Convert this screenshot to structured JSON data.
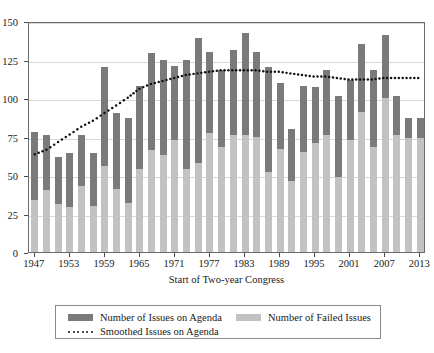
{
  "chart_data": {
    "type": "bar",
    "title": "",
    "subtitle": "",
    "xlabel": "Start of Two-year Congress",
    "ylabel": "",
    "grid": true,
    "stacked": true,
    "legend_position": "bottom",
    "xlim": [
      1946,
      2014
    ],
    "ylim": [
      0,
      150
    ],
    "yticks": [
      0,
      25,
      50,
      75,
      100,
      125,
      150
    ],
    "ytick_labels": [
      "0",
      "25",
      "50",
      "75",
      "100",
      "125",
      "150"
    ],
    "xticks": [
      1947,
      1953,
      1959,
      1965,
      1971,
      1977,
      1983,
      1989,
      1995,
      2001,
      2007,
      2013
    ],
    "xtick_labels": [
      "1947",
      "1953",
      "1959",
      "1965",
      "1971",
      "1977",
      "1983",
      "1989",
      "1995",
      "2001",
      "2007",
      "2013"
    ],
    "x": [
      1947,
      1949,
      1951,
      1953,
      1955,
      1957,
      1959,
      1961,
      1963,
      1965,
      1967,
      1969,
      1971,
      1973,
      1975,
      1977,
      1979,
      1981,
      1983,
      1985,
      1987,
      1989,
      1991,
      1993,
      1995,
      1997,
      1999,
      2001,
      2003,
      2005,
      2007,
      2009,
      2011,
      2013
    ],
    "series": [
      {
        "name": "Number of Issues on Agenda",
        "color": "#7a7a7a",
        "values": [
          78,
          76,
          62,
          64,
          76,
          64,
          120,
          90,
          87,
          108,
          129,
          125,
          121,
          125,
          139,
          130,
          118,
          131,
          142,
          130,
          120,
          110,
          80,
          108,
          107,
          118,
          101,
          112,
          135,
          118,
          141,
          101,
          87,
          87
        ]
      },
      {
        "name": "Number of Failed Issues",
        "color": "#c2c2c2",
        "values": [
          34,
          40,
          31,
          29,
          43,
          30,
          56,
          41,
          32,
          54,
          66,
          63,
          73,
          54,
          58,
          77,
          68,
          76,
          76,
          75,
          52,
          67,
          46,
          65,
          71,
          76,
          49,
          73,
          91,
          68,
          100,
          76,
          74,
          74
        ]
      }
    ],
    "smoothed_line": {
      "name": "Smoothed Issues on Agenda",
      "color": "#111111",
      "style": "dotted",
      "x": [
        1947,
        1949,
        1951,
        1953,
        1955,
        1957,
        1959,
        1961,
        1963,
        1965,
        1967,
        1969,
        1971,
        1973,
        1975,
        1977,
        1979,
        1981,
        1983,
        1985,
        1987,
        1989,
        1991,
        1993,
        1995,
        1997,
        1999,
        2001,
        2003,
        2005,
        2007,
        2009,
        2011,
        2013
      ],
      "values": [
        64,
        67,
        72,
        77,
        82,
        86,
        91,
        96,
        101,
        107,
        110,
        112,
        114,
        116,
        117,
        118,
        119,
        119,
        119,
        119,
        118,
        118,
        117,
        116,
        115,
        115,
        114,
        113,
        113,
        113,
        114,
        114,
        114,
        114
      ]
    }
  },
  "axes": {
    "x_title": "Start of Two-year Congress"
  },
  "legend": {
    "items": [
      {
        "label": "Number of Issues on Agenda",
        "marker": "swatch-dark",
        "color": "#7a7a7a"
      },
      {
        "label": "Number of Failed Issues",
        "marker": "swatch-light",
        "color": "#c2c2c2"
      },
      {
        "label": "Smoothed Issues on Agenda",
        "marker": "dotted-line",
        "color": "#111111"
      }
    ]
  }
}
